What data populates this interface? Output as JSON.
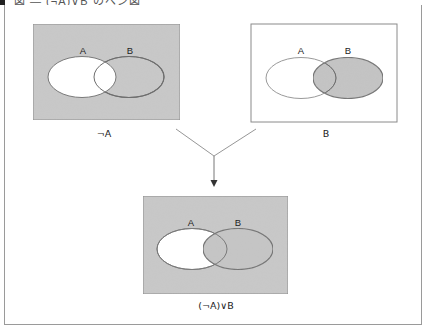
{
  "figure": {
    "header_text": "図 — (¬A)∨B のベン図",
    "colors": {
      "shade": "#c9c9c9",
      "shade_border": "#8a8a8a",
      "white": "#ffffff",
      "outline": "#7a7a7a",
      "arrow": "#666666"
    },
    "diagrams": [
      {
        "id": "not-a",
        "caption": "¬A",
        "set_a_label": "A",
        "set_b_label": "B",
        "shaded_regions": [
          "outside A",
          "B only"
        ]
      },
      {
        "id": "b",
        "caption": "B",
        "set_a_label": "A",
        "set_b_label": "B",
        "shaded_regions": [
          "B"
        ]
      },
      {
        "id": "not-a-or-b",
        "caption": "(¬A)∨B",
        "set_a_label": "A",
        "set_b_label": "B",
        "shaded_regions": [
          "outside A",
          "B"
        ]
      }
    ],
    "connector": {
      "description": "Two lines from the upper diagrams merge and an arrow points down to the result diagram"
    }
  }
}
